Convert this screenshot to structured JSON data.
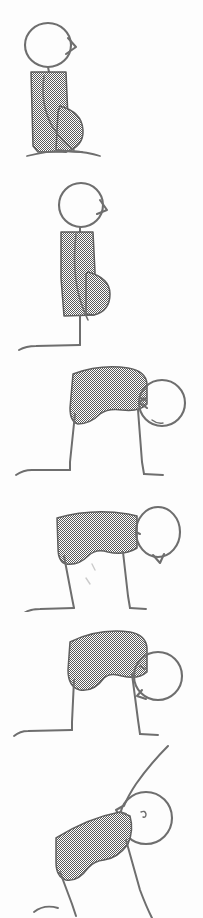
{
  "document": {
    "title": "Stick Figure Motion Sequence",
    "kind": "scanned line drawing",
    "orientation": "vertical filmstrip",
    "frame_count": 6,
    "width_px": 203,
    "height_px": 918
  },
  "palette": {
    "background": "#fdfdfd",
    "ink": "#6e6e6e",
    "mass_fill": "#808080",
    "mass_outline": "#5f5f5f",
    "dither_dark": "#5a5a5a",
    "dither_light": "#ffffff"
  },
  "render": {
    "dither_tile_px": 2,
    "stroke_width_thin": 1.6,
    "stroke_width_outline": 2.1
  },
  "frames": [
    {
      "index": 1,
      "name": "frame-1-upright-kneel",
      "caption": "Upright kneeling pose, head high, torso vertical, haunches on ground",
      "top_px": 4,
      "height_px": 156,
      "head": {
        "cx": 48,
        "cy": 45,
        "rx": 23,
        "ry": 22,
        "beak_dir": "right"
      },
      "torso": {
        "angle_deg": 88,
        "state": "vertical"
      },
      "legs": {
        "count": 1,
        "state": "folded",
        "foot_dir": "right"
      }
    },
    {
      "index": 2,
      "name": "frame-2-rising-kneel",
      "caption": "Head lifts slightly, torso still vertical, one leg extends down to the foot",
      "top_px": 170,
      "height_px": 180,
      "head": {
        "cx": 80,
        "cy": 205,
        "rx": 22,
        "ry": 22,
        "beak_dir": "right"
      },
      "torso": {
        "angle_deg": 85,
        "state": "vertical"
      },
      "legs": {
        "count": 1,
        "state": "extended",
        "foot_dir": "left"
      }
    },
    {
      "index": 3,
      "name": "frame-3-bent-over",
      "caption": "Torso rotates to horizontal, head swings out to the right, two legs planted",
      "top_px": 360,
      "height_px": 125,
      "head": {
        "cx": 161,
        "cy": 403,
        "rx": 23,
        "ry": 23,
        "beak_dir": "left"
      },
      "torso": {
        "angle_deg": 8,
        "state": "horizontal"
      },
      "legs": {
        "count": 2,
        "state": "planted",
        "foot_dir": "left"
      }
    },
    {
      "index": 4,
      "name": "frame-4-head-raised",
      "caption": "Torso flattens further, head raised high on the right, legs narrow and straight",
      "top_px": 492,
      "height_px": 118,
      "head": {
        "cx": 159,
        "cy": 532,
        "rx": 22,
        "ry": 24,
        "beak_dir": "down-left"
      },
      "torso": {
        "angle_deg": 3,
        "state": "flat"
      },
      "legs": {
        "count": 2,
        "state": "straight",
        "foot_dir": "left"
      }
    },
    {
      "index": 5,
      "name": "frame-5-deep-bend",
      "caption": "Deep bend, bulky torso mass, head tucked low against the right shoulder",
      "top_px": 618,
      "height_px": 122,
      "head": {
        "cx": 157,
        "cy": 672,
        "rx": 24,
        "ry": 24,
        "beak_dir": "down-left"
      },
      "torso": {
        "angle_deg": 5,
        "state": "bent"
      },
      "legs": {
        "count": 2,
        "state": "planted",
        "foot_dir": "left"
      }
    },
    {
      "index": 6,
      "name": "frame-6-rising-with-arm",
      "caption": "Figure rises: arm sweeps up from the head, torso tilts, eye mark visible on face",
      "top_px": 748,
      "height_px": 170,
      "head": {
        "cx": 146,
        "cy": 806,
        "rx": 26,
        "ry": 26,
        "beak_dir": "left"
      },
      "torso": {
        "angle_deg": 18,
        "state": "tilted-up"
      },
      "legs": {
        "count": 2,
        "state": "pushing",
        "foot_dir": "left"
      },
      "arm": {
        "present": true,
        "direction": "up-right"
      },
      "face_detail": "eye-mark"
    }
  ]
}
